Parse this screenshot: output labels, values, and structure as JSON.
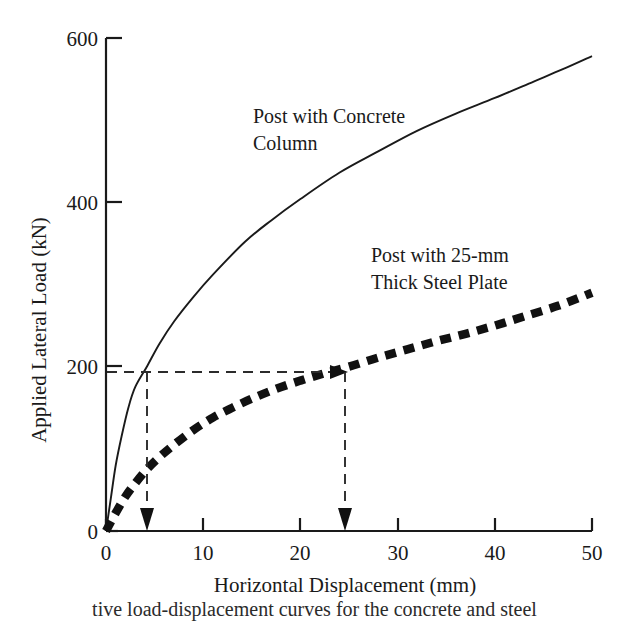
{
  "chart_data": {
    "type": "line",
    "title": "",
    "xlabel": "Horizontal Displacement (mm)",
    "ylabel": "Applied Lateral Load (kN)",
    "xlim": [
      0,
      50
    ],
    "ylim": [
      0,
      600
    ],
    "xticks": [
      0,
      10,
      20,
      30,
      40,
      50
    ],
    "yticks": [
      0,
      200,
      400,
      600
    ],
    "xtick_labels": [
      "0",
      "10",
      "20",
      "30",
      "40",
      "50"
    ],
    "ytick_labels": [
      "0",
      "200",
      "400",
      "600"
    ],
    "grid": false,
    "legend_position": "inline-annotation",
    "series": [
      {
        "name": "Post with Concrete Column",
        "style": "solid",
        "color": "#1a1a1a",
        "x": [
          0,
          0.5,
          1.0,
          1.6,
          2.3,
          3.0,
          4.2,
          5.5,
          7.0,
          9.0,
          11.0,
          14.3,
          17.0,
          20.0,
          24.0,
          28.0,
          32.0,
          36.0,
          40.0,
          44.0,
          47.0,
          50.0
        ],
        "y": [
          0,
          40,
          80,
          115,
          150,
          175,
          200,
          228,
          255,
          285,
          312,
          352,
          378,
          404,
          436,
          462,
          487,
          508,
          527,
          547,
          562,
          578
        ]
      },
      {
        "name": "Post with 25-mm Thick Steel Plate",
        "style": "dotted",
        "color": "#111111",
        "x": [
          0,
          1.0,
          2.0,
          3.0,
          4.2,
          5.5,
          7.0,
          9.0,
          11.0,
          13.0,
          15.0,
          17.5,
          20.0,
          22.5,
          25.0,
          28.0,
          31.0,
          34.0,
          37.0,
          40.0,
          43.0,
          46.5,
          50.0
        ],
        "y": [
          0,
          22,
          42,
          58,
          75,
          90,
          105,
          123,
          138,
          150,
          161,
          173,
          183,
          192,
          200,
          211,
          221,
          231,
          240,
          250,
          261,
          274,
          290
        ]
      }
    ],
    "annotations": [
      {
        "name": "load-level-guide",
        "kind": "horizontal-dashed-line",
        "y": 200,
        "x_from": 0,
        "x_to": 25,
        "arrow_at": "right-end"
      },
      {
        "name": "concrete-column-displacement-drop",
        "kind": "vertical-dashed-line-with-down-arrow",
        "x": 4.2,
        "y_from": 200,
        "y_to": 0
      },
      {
        "name": "steel-plate-displacement-drop",
        "kind": "vertical-dashed-line-with-down-arrow",
        "x": 25.0,
        "y_from": 200,
        "y_to": 0
      }
    ],
    "series_labels": [
      {
        "text_line1": "Post with Concrete",
        "text_line2": "Column",
        "x": 14.0,
        "y": 505
      },
      {
        "text_line1": "Post with 25-mm",
        "text_line2": "Thick Steel Plate",
        "x": 27.5,
        "y": 345
      }
    ]
  },
  "axes": {
    "y_title": "Applied Lateral Load (kN)",
    "x_title": "Horizontal Displacement (mm)",
    "y_tick_600": "600",
    "y_tick_400": "400",
    "y_tick_200": "200",
    "y_tick_0": "0",
    "x_tick_0": "0",
    "x_tick_10": "10",
    "x_tick_20": "20",
    "x_tick_30": "30",
    "x_tick_40": "40",
    "x_tick_50": "50"
  },
  "labels": {
    "concrete_line1": "Post with Concrete",
    "concrete_line2": "Column",
    "steel_line1": "Post with 25-mm",
    "steel_line2": "Thick Steel Plate"
  },
  "caption": {
    "text": "tive load-displacement curves for the concrete and steel"
  },
  "colors": {
    "ink": "#1a1a1a",
    "background": "#ffffff",
    "dashed_guide": "#2b2b2b"
  }
}
